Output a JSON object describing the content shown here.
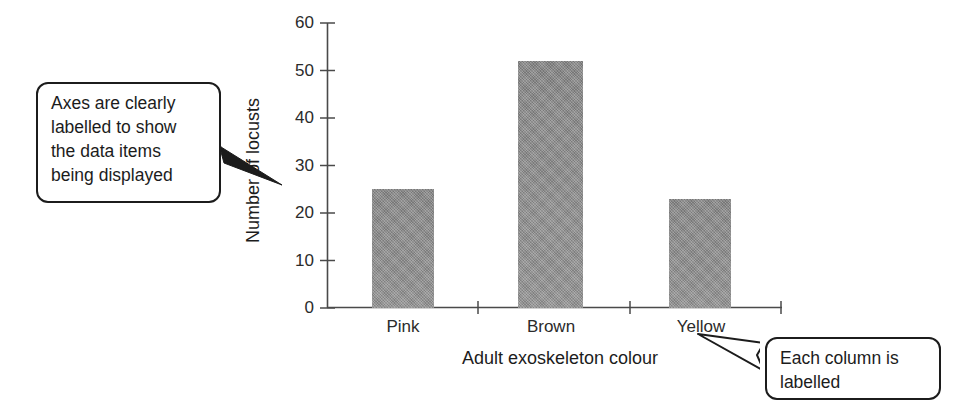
{
  "chart_data": {
    "type": "bar",
    "title": "",
    "categories": [
      "Pink",
      "Brown",
      "Yellow"
    ],
    "values": [
      25,
      52,
      23
    ],
    "xlabel": "Adult exoskeleton colour",
    "ylabel": "Number of locusts",
    "ylim": [
      0,
      60
    ],
    "ytick_labels": [
      "0",
      "10",
      "20",
      "30",
      "40",
      "50",
      "60"
    ],
    "ytick_values": [
      0,
      10,
      20,
      30,
      40,
      50,
      60
    ],
    "ytick_interval": 10,
    "grid": false,
    "legend": false,
    "bar_color": "#8d8d8d",
    "axis_color": "#4a4a4a"
  },
  "annotations": {
    "axes_callout": {
      "lines": [
        "Axes are clearly",
        "labelled to show",
        "the data items",
        "being displayed"
      ]
    },
    "columns_callout": {
      "lines": [
        "Each column is",
        "labelled"
      ]
    }
  }
}
